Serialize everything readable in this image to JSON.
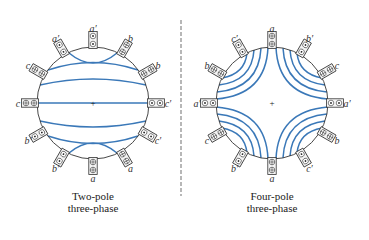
{
  "colors": {
    "flux": "#3a78b8",
    "outline": "#333333",
    "slot_fill": "#f4f4f4",
    "divider": "#888888"
  },
  "divider": {
    "style": "dashed",
    "x": 181
  },
  "diagrams": [
    {
      "id": "two-pole",
      "caption": {
        "line1": "Two-pole",
        "line2": "three-phase"
      },
      "center": [
        93,
        103
      ],
      "radius": 56,
      "slots": [
        {
          "angle": 90,
          "label": "a′",
          "symbol": "dot"
        },
        {
          "angle": 60,
          "label": "b",
          "symbol": "cross"
        },
        {
          "angle": 30,
          "label": "b",
          "symbol": "cross"
        },
        {
          "angle": 0,
          "label": "c′",
          "symbol": "dot"
        },
        {
          "angle": -30,
          "label": "c′",
          "symbol": "dot"
        },
        {
          "angle": -60,
          "label": "a",
          "symbol": "cross"
        },
        {
          "angle": -90,
          "label": "a",
          "symbol": "cross"
        },
        {
          "angle": -120,
          "label": "b′",
          "symbol": "dot"
        },
        {
          "angle": -150,
          "label": "b′",
          "symbol": "dot"
        },
        {
          "angle": 180,
          "label": "c",
          "symbol": "cross"
        },
        {
          "angle": 150,
          "label": "c",
          "symbol": "cross"
        },
        {
          "angle": 120,
          "label": "a′",
          "symbol": "dot"
        }
      ],
      "center_mark": "+"
    },
    {
      "id": "four-pole",
      "caption": {
        "line1": "Four-pole",
        "line2": "three-phase"
      },
      "center": [
        272,
        103
      ],
      "radius": 56,
      "slots": [
        {
          "angle": 90,
          "label": "a",
          "symbol": "cross"
        },
        {
          "angle": 60,
          "label": "b′",
          "symbol": "dot"
        },
        {
          "angle": 30,
          "label": "c",
          "symbol": "cross"
        },
        {
          "angle": 0,
          "label": "a′",
          "symbol": "dot"
        },
        {
          "angle": -30,
          "label": "b",
          "symbol": "cross"
        },
        {
          "angle": -60,
          "label": "c′",
          "symbol": "dot"
        },
        {
          "angle": -90,
          "label": "a",
          "symbol": "cross"
        },
        {
          "angle": -120,
          "label": "b′",
          "symbol": "dot"
        },
        {
          "angle": -150,
          "label": "c",
          "symbol": "cross"
        },
        {
          "angle": 180,
          "label": "a′",
          "symbol": "dot"
        },
        {
          "angle": 150,
          "label": "b",
          "symbol": "cross"
        },
        {
          "angle": 120,
          "label": "c′",
          "symbol": "dot"
        }
      ],
      "center_mark": "+"
    }
  ]
}
